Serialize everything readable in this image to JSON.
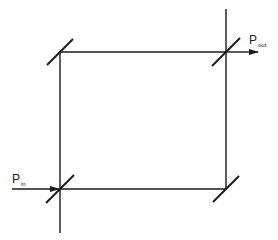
{
  "diagram": {
    "type": "mach-zehnder-interferometer",
    "labels": {
      "input": {
        "main": "P",
        "sub": "in"
      },
      "output": {
        "main": "P",
        "sub": "out"
      }
    },
    "colors": {
      "line": "#1a1a1a",
      "background": "#ffffff"
    },
    "mirrors": [
      {
        "name": "beam-splitter-input",
        "corner": "bottom-left"
      },
      {
        "name": "mirror-top-left",
        "corner": "top-left"
      },
      {
        "name": "beam-splitter-output",
        "corner": "top-right"
      },
      {
        "name": "mirror-bottom-right",
        "corner": "bottom-right"
      }
    ]
  }
}
